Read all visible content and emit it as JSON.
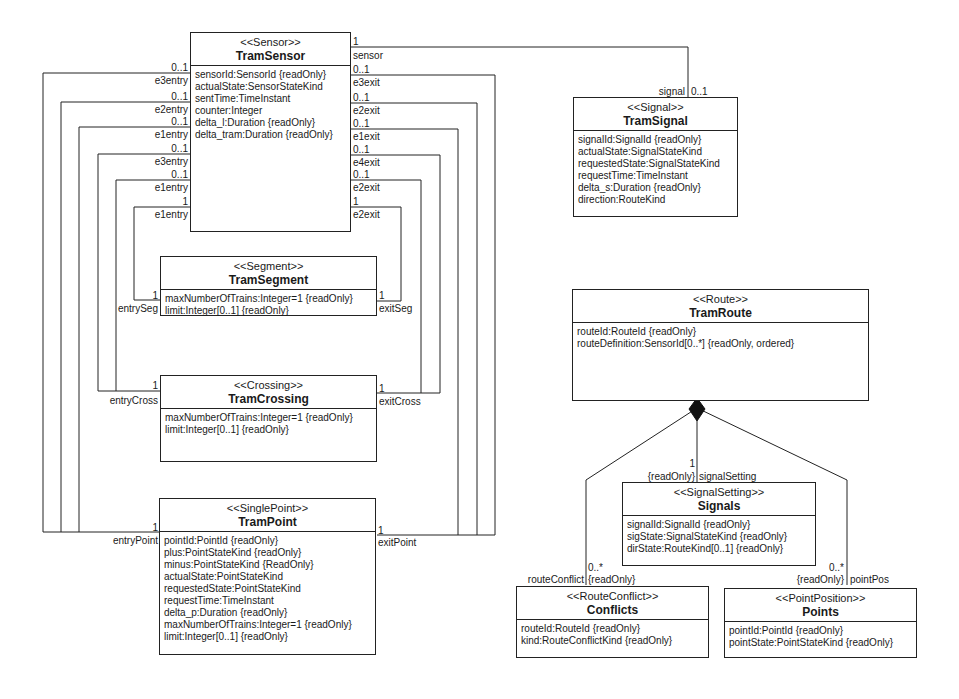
{
  "diagram": {
    "classes": {
      "sensor": {
        "stereotype": "<<Sensor>>",
        "name": "TramSensor",
        "attributes": [
          "sensorId:SensorId {readOnly}",
          "actualState:SensorStateKind",
          "sentTime:TimeInstant",
          "counter:Integer",
          "delta_l:Duration {readOnly}",
          "delta_tram:Duration {readOnly}"
        ]
      },
      "signal": {
        "stereotype": "<<Signal>>",
        "name": "TramSignal",
        "attributes": [
          "signalId:SignalId {readOnly}",
          "actualState:SignalStateKind",
          "requestedState:SignalStateKind",
          "requestTime:TimeInstant",
          "delta_s:Duration {readOnly}",
          "direction:RouteKind"
        ]
      },
      "segment": {
        "stereotype": "<<Segment>>",
        "name": "TramSegment",
        "attributes": [
          "maxNumberOfTrains:Integer=1 {readOnly}",
          "limit:Integer[0..1] {readOnly}"
        ]
      },
      "crossing": {
        "stereotype": "<<Crossing>>",
        "name": "TramCrossing",
        "attributes": [
          "maxNumberOfTrains:Integer=1 {readOnly}",
          "limit:Integer[0..1] {readOnly}"
        ]
      },
      "point": {
        "stereotype": "<<SinglePoint>>",
        "name": "TramPoint",
        "attributes": [
          "pointId:PointId {readOnly}",
          "plus:PointStateKind {readOnly}",
          "minus:PointStateKind {ReadOnly}",
          "actualState:PointStateKind",
          "requestedState:PointStateKind",
          "requestTime:TimeInstant",
          "delta_p:Duration {readOnly}",
          "maxNumberOfTrains:Integer=1 {readOnly}",
          "limit:Integer[0..1] {readOnly}"
        ]
      },
      "route": {
        "stereotype": "<<Route>>",
        "name": "TramRoute",
        "attributes": [
          "routeId:RouteId {readOnly}",
          "routeDefinition:SensorId[0..*] {readOnly, ordered}"
        ]
      },
      "signals": {
        "stereotype": "<<SignalSetting>>",
        "name": "Signals",
        "attributes": [
          "signalId:SignalId {readOnly}",
          "sigState:SignalStateKind {readOnly}",
          "dirState:RouteKind[0..1] {readOnly}"
        ]
      },
      "conflicts": {
        "stereotype": "<<RouteConflict>>",
        "name": "Conflicts",
        "attributes": [
          "routeId:RouteId {readOnly}",
          "kind:RouteConflictKind {readOnly}"
        ]
      },
      "points": {
        "stereotype": "<<PointPosition>>",
        "name": "Points",
        "attributes": [
          "pointId:PointId {readOnly}",
          "pointState:PointStateKind {readOnly}"
        ]
      }
    },
    "sensor_left_ends": [
      {
        "mult": "0..1",
        "role": "e3entry"
      },
      {
        "mult": "0..1",
        "role": "e2entry"
      },
      {
        "mult": "0..1",
        "role": "e1entry"
      },
      {
        "mult": "0..1",
        "role": "e3entry"
      },
      {
        "mult": "0..1",
        "role": "e1entry"
      },
      {
        "mult": "1",
        "role": "e1entry"
      }
    ],
    "sensor_right_ends": [
      {
        "mult": "1",
        "role": "sensor"
      },
      {
        "mult": "0..1",
        "role": "e3exit"
      },
      {
        "mult": "0..1",
        "role": "e2exit"
      },
      {
        "mult": "0..1",
        "role": "e1exit"
      },
      {
        "mult": "0..1",
        "role": "e4exit"
      },
      {
        "mult": "0..1",
        "role": "e2exit"
      },
      {
        "mult": "1",
        "role": "e2exit"
      }
    ],
    "ends": {
      "signal_role": "signal",
      "signal_mult": "0..1",
      "segment_entry_mult": "1",
      "segment_entry_role": "entrySeg",
      "segment_exit_mult": "1",
      "segment_exit_role": "exitSeg",
      "crossing_entry_mult": "1",
      "crossing_entry_role": "entryCross",
      "crossing_exit_mult": "1",
      "crossing_exit_role": "exitCross",
      "point_entry_mult": "1",
      "point_entry_role": "entryPoint",
      "point_exit_mult": "1",
      "point_exit_role": "exitPoint",
      "signalsetting_mult": "1",
      "signalsetting_constraint": "{readOnly}",
      "signalsetting_role": "signalSetting",
      "conflict_mult": "0..*",
      "conflict_role": "routeConflict",
      "conflict_constraint": "{readOnly}",
      "pointpos_mult": "0..*",
      "pointpos_constraint": "{readOnly}",
      "pointpos_role": "pointPos"
    }
  }
}
